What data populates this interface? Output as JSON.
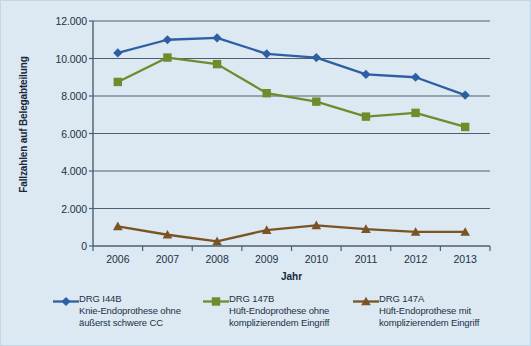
{
  "chart_data": {
    "type": "line",
    "title": "",
    "xlabel": "Jahr",
    "ylabel": "Fallzahlen auf Belegabteilung",
    "categories": [
      "2006",
      "2007",
      "2008",
      "2009",
      "2010",
      "2011",
      "2012",
      "2013"
    ],
    "ylim": [
      0,
      12000
    ],
    "ytick_labels": [
      "0",
      "2.000",
      "4.000",
      "6.000",
      "8.000",
      "10.000",
      "12.000"
    ],
    "ytick_values": [
      0,
      2000,
      4000,
      6000,
      8000,
      10000,
      12000
    ],
    "grid": true,
    "legend_position": "bottom",
    "series": [
      {
        "name": "DRG I44B",
        "description_line1": "Knie-Endoprothese ohne",
        "description_line2": "äußerst schwere CC",
        "color": "#2e5fa3",
        "marker": "diamond",
        "values": [
          10300,
          11000,
          11100,
          10250,
          10050,
          9150,
          9000,
          8050
        ]
      },
      {
        "name": "DRG 147B",
        "description_line1": "Hüft-Endoprothese ohne",
        "description_line2": "komplizierendem Eingriff",
        "color": "#6d8c2c",
        "marker": "square",
        "values": [
          8750,
          10050,
          9700,
          8150,
          7700,
          6900,
          7100,
          6350
        ]
      },
      {
        "name": "DRG 147A",
        "description_line1": "Hüft-Endoprothese mit",
        "description_line2": "komplizierendem Eingriff",
        "color": "#7a5423",
        "marker": "triangle",
        "values": [
          1050,
          600,
          250,
          850,
          1100,
          900,
          750,
          750
        ]
      }
    ]
  },
  "colors": {
    "background": "#dce8f2",
    "axis": "#4b6173",
    "grid": "#4b6173",
    "text": "#1c3245"
  }
}
